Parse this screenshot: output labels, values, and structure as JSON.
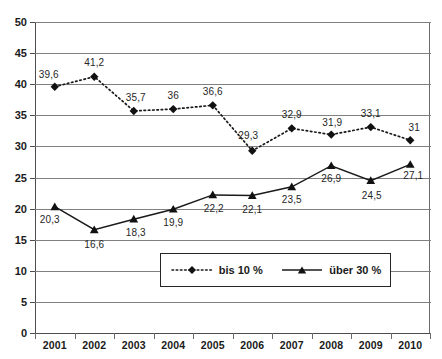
{
  "chart_data": {
    "type": "line",
    "title": "",
    "xlabel": "",
    "ylabel": "",
    "ylim": [
      0,
      50
    ],
    "ytick_step": 5,
    "grid": true,
    "legend_position": "inside-bottom-center",
    "decimal_separator": ",",
    "categories": [
      "2001",
      "2002",
      "2003",
      "2004",
      "2005",
      "2006",
      "2007",
      "2008",
      "2009",
      "2010"
    ],
    "series": [
      {
        "name": "bis 10 %",
        "marker": "diamond",
        "line_style": "dotted",
        "color": "#1a1a1a",
        "values": [
          39.6,
          41.2,
          35.7,
          36,
          36.6,
          29.3,
          32.9,
          31.9,
          33.1,
          31
        ],
        "labels": [
          "39,6",
          "41,2",
          "35,7",
          "36",
          "36,6",
          "29,3",
          "32,9",
          "31,9",
          "33,1",
          "31"
        ]
      },
      {
        "name": "über 30 %",
        "marker": "triangle",
        "line_style": "solid",
        "color": "#1a1a1a",
        "values": [
          20.3,
          16.6,
          18.3,
          19.9,
          22.2,
          22.1,
          23.5,
          26.9,
          24.5,
          27.1
        ],
        "labels": [
          "20,3",
          "16,6",
          "18,3",
          "19,9",
          "22,2",
          "22,1",
          "23,5",
          "26,9",
          "24,5",
          "27,1"
        ]
      }
    ],
    "yticks": [
      "0",
      "5",
      "10",
      "15",
      "20",
      "25",
      "30",
      "35",
      "40",
      "45",
      "50"
    ]
  },
  "legend": {
    "entries": [
      {
        "label": "bis 10 %",
        "key": "dotted-diamond-key"
      },
      {
        "label": "über 30 %",
        "key": "solid-triangle-key"
      }
    ]
  },
  "colors": {
    "series": "#1a1a1a",
    "gridline": "#808080",
    "axis": "#4d4d4d",
    "background": "#ffffff",
    "label_text": "#262626"
  }
}
